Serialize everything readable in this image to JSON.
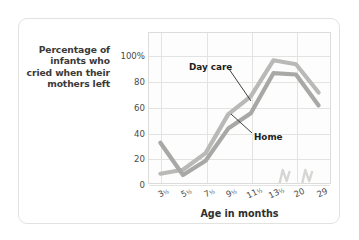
{
  "caption": {
    "y_axis_caption": "Percentage of infants who cried when their mothers left",
    "y_axis_caption_lines": [
      "Percentage of",
      "infants who",
      "cried when their",
      "mothers left"
    ]
  },
  "colors": {
    "day_care_line": "#b9b9b7",
    "home_line": "#a8a8a6",
    "grid": "#e3e3e1",
    "plot_border": "#dcdcda",
    "card_border": "#e2e2e0",
    "text": "#2f2f2d",
    "background": "#ffffff"
  },
  "chart_data": {
    "type": "line",
    "title": "",
    "subtitle": "",
    "xlabel": "Age in months",
    "ylabel": "Percentage of infants who cried when their mothers left",
    "x": [
      "3½",
      "5½",
      "7½",
      "9½",
      "11½",
      "13½",
      "20",
      "29"
    ],
    "x_tick_labels": [
      "3½",
      "5½",
      "7½",
      "9½",
      "11½",
      "13½",
      "20",
      "29"
    ],
    "y_tick_labels": [
      "0",
      "20",
      "40",
      "60",
      "80",
      "100%"
    ],
    "y_ticks": [
      0,
      20,
      40,
      60,
      80,
      100
    ],
    "ylim": [
      0,
      118
    ],
    "xlim_note": "axis break between 13½ and 20 months",
    "grid": true,
    "legend": "inline-annotations",
    "legend_position": "inline",
    "series": [
      {
        "name": "Day care",
        "color": "#b9b9b7",
        "values": [
          8,
          11,
          24,
          54,
          68,
          96,
          93,
          71
        ]
      },
      {
        "name": "Home",
        "color": "#a8a8a6",
        "values": [
          32,
          7,
          18,
          43,
          55,
          86,
          85,
          61
        ]
      }
    ],
    "annotations": [
      {
        "label": "Day care",
        "target_x": "9½",
        "target_y": 54
      },
      {
        "label": "Home",
        "target_x": "11½",
        "target_y": 55
      }
    ],
    "axis_break": {
      "present": true,
      "between": [
        "13½",
        "20"
      ],
      "style": "zigzag"
    }
  }
}
